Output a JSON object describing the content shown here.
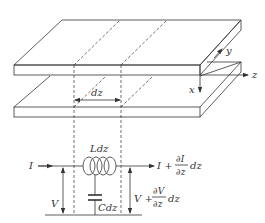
{
  "diagram": {
    "axes": {
      "x": "x",
      "y": "y",
      "z": "z"
    },
    "section_label": "dz",
    "circuit": {
      "inductor_label": "Ldz",
      "capacitor_label": "Cdz",
      "input_current": "I",
      "input_voltage": "V",
      "output_current": {
        "base": "I +",
        "num": "∂I",
        "den": "∂z",
        "tail": "dz"
      },
      "output_voltage": {
        "base": "V +",
        "num": "∂V",
        "den": "∂z",
        "tail": "dz"
      }
    }
  }
}
